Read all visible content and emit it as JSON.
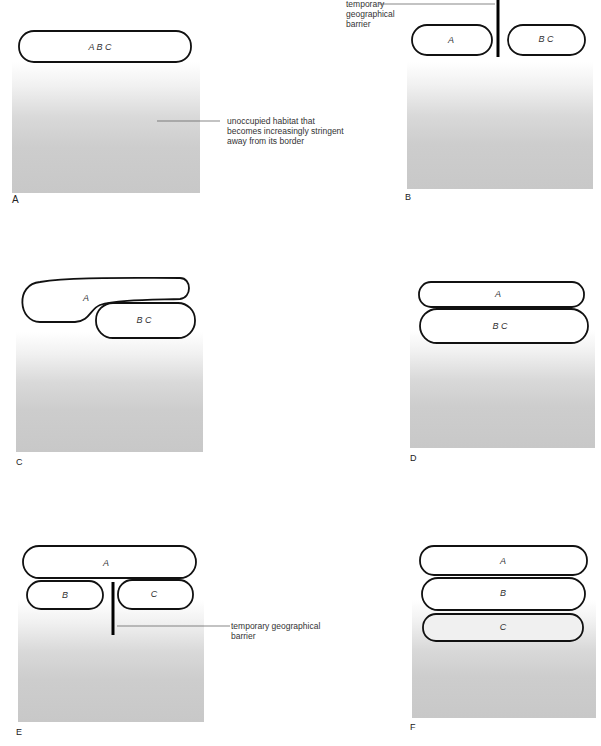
{
  "panels": [
    {
      "id": "A",
      "label": "A",
      "populations": [
        "A B C"
      ],
      "annotation": "unoccupied habitat that becomes increasingly stringent away from its border",
      "annotation_lines": [
        "unoccupied habitat that",
        "becomes increasingly stringent",
        "away from its border"
      ]
    },
    {
      "id": "B",
      "label": "B",
      "populations": [
        "A",
        "B C"
      ],
      "annotation_lines": [
        "temporary",
        "geographical",
        "barrier"
      ]
    },
    {
      "id": "C",
      "label": "C",
      "populations": [
        "A",
        "B C"
      ]
    },
    {
      "id": "D",
      "label": "D",
      "populations": [
        "A",
        "B C"
      ]
    },
    {
      "id": "E",
      "label": "E",
      "populations": [
        "A",
        "B",
        "C"
      ],
      "annotation_lines": [
        "temporary geographical",
        "barrier"
      ]
    },
    {
      "id": "F",
      "label": "F",
      "populations": [
        "A",
        "B",
        "C"
      ]
    }
  ],
  "colors": {
    "outline": "#111111",
    "habitat_light": "#ffffff",
    "habitat_dark": "#c8c8c8",
    "text": "#333333"
  }
}
